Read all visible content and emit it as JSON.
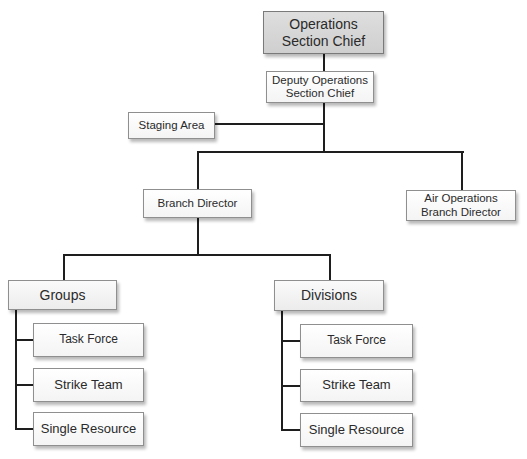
{
  "diagram": {
    "type": "org-chart",
    "root": {
      "label": "Operations\nSection Chief",
      "line1": "Operations",
      "line2": "Section Chief"
    },
    "deputy": {
      "line1": "Deputy Operations",
      "line2": "Section Chief"
    },
    "staging": {
      "label": "Staging Area"
    },
    "branch": {
      "label": "Branch Director"
    },
    "air_ops": {
      "line1": "Air Operations",
      "line2": "Branch Director"
    },
    "groups": {
      "label": "Groups",
      "children": [
        "Task Force",
        "Strike Team",
        "Single Resource"
      ]
    },
    "divisions": {
      "label": "Divisions",
      "children": [
        "Task Force",
        "Strike Team",
        "Single Resource"
      ]
    },
    "colors": {
      "root_fill": "#d6d6d6",
      "box_fill": "#ffffff",
      "border": "#8f8f8f",
      "line": "#1e1e1e"
    }
  }
}
